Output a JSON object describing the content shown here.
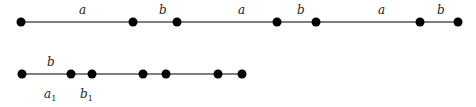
{
  "diagram": {
    "rows": [
      {
        "id": "row-1",
        "y": 22,
        "line": [
          21,
          458
        ],
        "points": [
          21,
          133,
          177,
          277,
          316,
          420,
          458
        ],
        "labels": [
          {
            "text": "a",
            "x": 79,
            "y": 14
          },
          {
            "text": "b",
            "x": 159,
            "y": 14
          },
          {
            "text": "a",
            "x": 238,
            "y": 14
          },
          {
            "text": "b",
            "x": 297,
            "y": 14
          },
          {
            "text": "a",
            "x": 378,
            "y": 14
          },
          {
            "text": "b",
            "x": 437,
            "y": 14
          }
        ]
      },
      {
        "id": "row-2",
        "y": 74,
        "line": [
          22,
          242
        ],
        "points": [
          22,
          71,
          92,
          143,
          166,
          218,
          242
        ],
        "labels": [
          {
            "text": "b",
            "x": 47,
            "y": 66
          },
          {
            "text": "a",
            "sub": "1",
            "x": 44,
            "y": 98
          },
          {
            "text": "b",
            "sub": "1",
            "x": 80,
            "y": 98
          }
        ]
      }
    ],
    "colors": {
      "line": "#555555",
      "point": "#000000"
    }
  }
}
